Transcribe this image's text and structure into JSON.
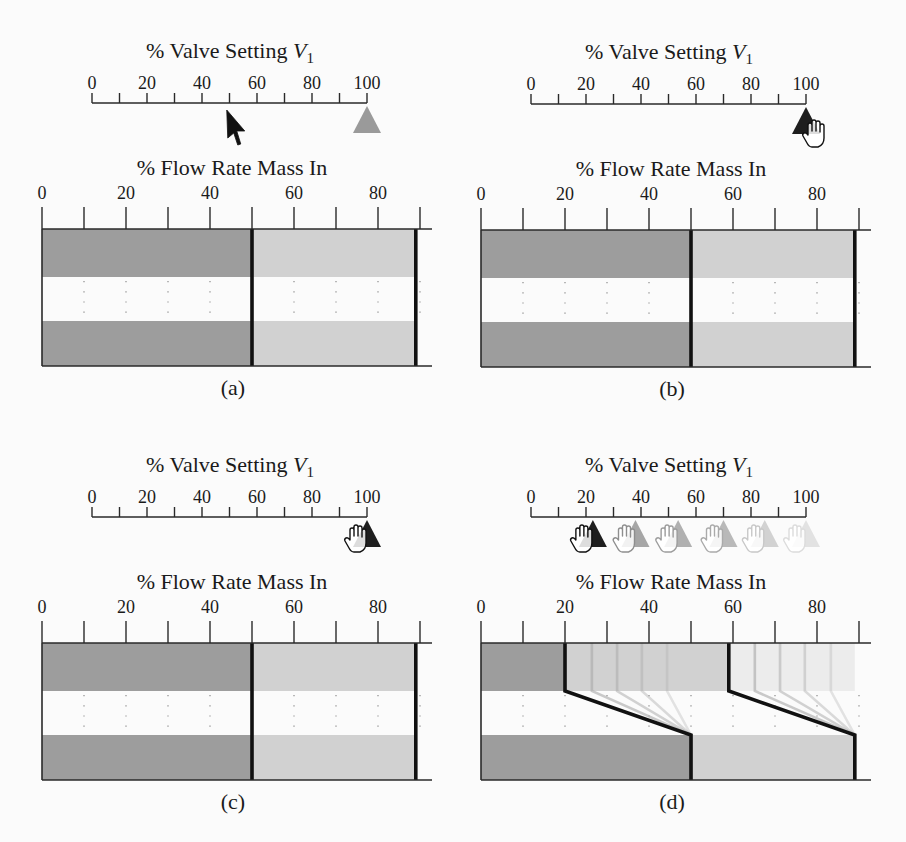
{
  "figure": {
    "colors": {
      "dark": "#9d9d9d",
      "light": "#d1d1d1",
      "faint": "#ececec",
      "line": "#111111",
      "axis": "#2a2a2a",
      "guide": "#8a8a8a"
    },
    "panels": [
      {
        "id": "a",
        "caption": "(a)",
        "valve_slider": {
          "title": "% Valve Setting ",
          "title_var": "V",
          "title_sub": "1",
          "min": 0,
          "max": 100,
          "tick_labels": [
            {
              "value": 0,
              "label": "0"
            },
            {
              "value": 20,
              "label": "20"
            },
            {
              "value": 40,
              "label": "40"
            },
            {
              "value": 60,
              "label": "60"
            },
            {
              "value": 80,
              "label": "80"
            },
            {
              "value": 100,
              "label": "100"
            }
          ],
          "markers": [
            {
              "value": 100,
              "color": "#9a9a9a",
              "opacity": 1,
              "hand": null,
              "hand_stroke": null
            }
          ],
          "cursor": {
            "type": "arrow",
            "value": 49
          }
        },
        "flow_display": {
          "title": "% Flow Rate Mass In",
          "tick_labels": [
            {
              "value": 0,
              "label": "0"
            },
            {
              "value": 20,
              "label": "20"
            },
            {
              "value": 40,
              "label": "40"
            },
            {
              "value": 60,
              "label": "60"
            },
            {
              "value": 80,
              "label": "80"
            }
          ],
          "top_band": [
            {
              "from": 0,
              "to": 50,
              "shade": "dark"
            },
            {
              "from": 50,
              "to": 89,
              "shade": "light"
            }
          ],
          "bottom_band": [
            {
              "from": 0,
              "to": 50,
              "shade": "dark"
            },
            {
              "from": 50,
              "to": 89,
              "shade": "light"
            }
          ],
          "boundaries": [
            {
              "top": 50,
              "bottom": 50
            },
            {
              "top": 89,
              "bottom": 89
            }
          ],
          "ghost_boundaries": []
        }
      },
      {
        "id": "b",
        "caption": "(b)",
        "valve_slider": {
          "title": "% Valve Setting ",
          "title_var": "V",
          "title_sub": "1",
          "min": 0,
          "max": 100,
          "tick_labels": [
            {
              "value": 0,
              "label": "0"
            },
            {
              "value": 20,
              "label": "20"
            },
            {
              "value": 40,
              "label": "40"
            },
            {
              "value": 60,
              "label": "60"
            },
            {
              "value": 80,
              "label": "80"
            },
            {
              "value": 100,
              "label": "100"
            }
          ],
          "markers": [
            {
              "value": 100,
              "color": "#1e1e1e",
              "opacity": 1,
              "hand": "right",
              "hand_stroke": "#111111"
            }
          ],
          "cursor": null
        },
        "flow_display": {
          "title": "% Flow Rate Mass In",
          "tick_labels": [
            {
              "value": 0,
              "label": "0"
            },
            {
              "value": 20,
              "label": "20"
            },
            {
              "value": 40,
              "label": "40"
            },
            {
              "value": 60,
              "label": "60"
            },
            {
              "value": 80,
              "label": "80"
            }
          ],
          "top_band": [
            {
              "from": 0,
              "to": 50,
              "shade": "dark"
            },
            {
              "from": 50,
              "to": 89,
              "shade": "light"
            }
          ],
          "bottom_band": [
            {
              "from": 0,
              "to": 50,
              "shade": "dark"
            },
            {
              "from": 50,
              "to": 89,
              "shade": "light"
            }
          ],
          "boundaries": [
            {
              "top": 50,
              "bottom": 50
            },
            {
              "top": 89,
              "bottom": 89
            }
          ],
          "ghost_boundaries": []
        }
      },
      {
        "id": "c",
        "caption": "(c)",
        "valve_slider": {
          "title": "% Valve Setting ",
          "title_var": "V",
          "title_sub": "1",
          "min": 0,
          "max": 100,
          "tick_labels": [
            {
              "value": 0,
              "label": "0"
            },
            {
              "value": 20,
              "label": "20"
            },
            {
              "value": 40,
              "label": "40"
            },
            {
              "value": 60,
              "label": "60"
            },
            {
              "value": 80,
              "label": "80"
            },
            {
              "value": 100,
              "label": "100"
            }
          ],
          "markers": [
            {
              "value": 100,
              "color": "#1e1e1e",
              "opacity": 1,
              "hand": "left",
              "hand_stroke": "#111111"
            }
          ],
          "cursor": null
        },
        "flow_display": {
          "title": "% Flow Rate Mass In",
          "tick_labels": [
            {
              "value": 0,
              "label": "0"
            },
            {
              "value": 20,
              "label": "20"
            },
            {
              "value": 40,
              "label": "40"
            },
            {
              "value": 60,
              "label": "60"
            },
            {
              "value": 80,
              "label": "80"
            }
          ],
          "top_band": [
            {
              "from": 0,
              "to": 50,
              "shade": "dark"
            },
            {
              "from": 50,
              "to": 89,
              "shade": "light"
            }
          ],
          "bottom_band": [
            {
              "from": 0,
              "to": 50,
              "shade": "dark"
            },
            {
              "from": 50,
              "to": 89,
              "shade": "light"
            }
          ],
          "boundaries": [
            {
              "top": 50,
              "bottom": 50
            },
            {
              "top": 89,
              "bottom": 89
            }
          ],
          "ghost_boundaries": []
        }
      },
      {
        "id": "d",
        "caption": "(d)",
        "valve_slider": {
          "title": "% Valve Setting ",
          "title_var": "V",
          "title_sub": "1",
          "min": 0,
          "max": 100,
          "tick_labels": [
            {
              "value": 0,
              "label": "0"
            },
            {
              "value": 20,
              "label": "20"
            },
            {
              "value": 40,
              "label": "40"
            },
            {
              "value": 60,
              "label": "60"
            },
            {
              "value": 80,
              "label": "80"
            },
            {
              "value": 100,
              "label": "100"
            }
          ],
          "markers": [
            {
              "value": 100,
              "color": "#e2e2e2",
              "opacity": 1,
              "hand": "left",
              "hand_stroke": "#dcdcdc"
            },
            {
              "value": 85,
              "color": "#d2d2d2",
              "opacity": 1,
              "hand": "left",
              "hand_stroke": "#c8c8c8"
            },
            {
              "value": 70,
              "color": "#b9b9b9",
              "opacity": 1,
              "hand": "left",
              "hand_stroke": "#aaaaaa"
            },
            {
              "value": 53.5,
              "color": "#b0b0b0",
              "opacity": 1,
              "hand": "left",
              "hand_stroke": "#9c9c9c"
            },
            {
              "value": 38,
              "color": "#a6a6a6",
              "opacity": 1,
              "hand": "left",
              "hand_stroke": "#8e8e8e"
            },
            {
              "value": 22.5,
              "color": "#1e1e1e",
              "opacity": 1,
              "hand": "left",
              "hand_stroke": "#111111"
            }
          ],
          "cursor": null
        },
        "flow_display": {
          "title": "% Flow Rate Mass In",
          "tick_labels": [
            {
              "value": 0,
              "label": "0"
            },
            {
              "value": 20,
              "label": "20"
            },
            {
              "value": 40,
              "label": "40"
            },
            {
              "value": 60,
              "label": "60"
            },
            {
              "value": 80,
              "label": "80"
            }
          ],
          "top_band": [
            {
              "from": 0,
              "to": 20,
              "shade": "dark"
            },
            {
              "from": 20,
              "to": 59,
              "shade": "light"
            },
            {
              "from": 59,
              "to": 89,
              "shade": "faint"
            }
          ],
          "bottom_band": [
            {
              "from": 0,
              "to": 50,
              "shade": "dark"
            },
            {
              "from": 50,
              "to": 89,
              "shade": "light"
            }
          ],
          "boundaries": [
            {
              "top": 20,
              "bottom": 50
            },
            {
              "top": 59,
              "bottom": 89
            }
          ],
          "ghost_boundaries": [
            {
              "top": 26.4,
              "bottom": 50,
              "opacity": 0.6
            },
            {
              "top": 32.4,
              "bottom": 50,
              "opacity": 0.5
            },
            {
              "top": 38.3,
              "bottom": 50,
              "opacity": 0.4
            },
            {
              "top": 44.3,
              "bottom": 50,
              "opacity": 0.3
            },
            {
              "top": 65.2,
              "bottom": 89,
              "opacity": 0.6
            },
            {
              "top": 71.2,
              "bottom": 89,
              "opacity": 0.5
            },
            {
              "top": 77.1,
              "bottom": 89,
              "opacity": 0.4
            },
            {
              "top": 83.3,
              "bottom": 89,
              "opacity": 0.3
            }
          ]
        }
      }
    ]
  }
}
